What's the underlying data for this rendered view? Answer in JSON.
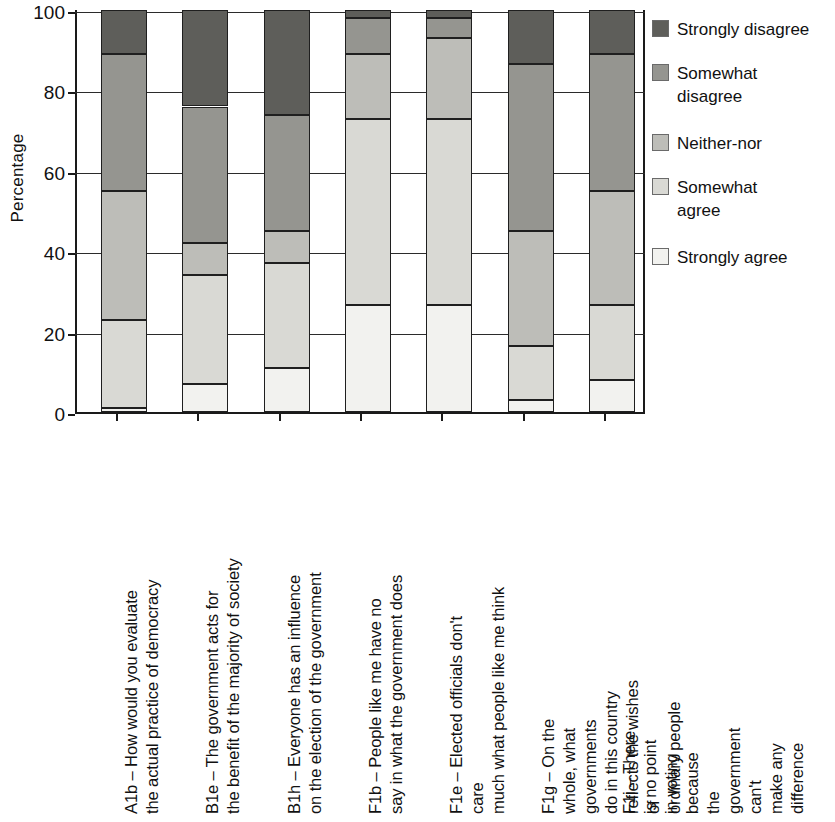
{
  "chart_data": {
    "type": "bar",
    "subtype": "stacked-bar-100",
    "title": "",
    "xlabel": "",
    "ylabel": "Percentage",
    "ylim": [
      0,
      100
    ],
    "yticks": [
      0,
      20,
      40,
      60,
      80,
      100
    ],
    "ytick_labels": [
      "0",
      "20",
      "40",
      "60",
      "80",
      "100"
    ],
    "grid": true,
    "legend_position": "right",
    "categories": [
      "A1b – How would you evaluate\nthe actual practice of democracy",
      "B1e – The government acts for\nthe benefit of the majority of society",
      "B1h – Everyone has an influence\non the election of the government",
      "F1b – People like me have no\nsay in what the government does",
      "F1e – Elected officials don't care\nmuch what people like me think",
      "F1g – On the whole, what governments\ndo in this country reflects the wishes of\nordinary people",
      "F1i – There is no point in voting\nbecause the government can't\nmake any difference"
    ],
    "series": [
      {
        "name": "Strongly agree",
        "color": "#f2f2ef",
        "values": [
          1,
          7,
          11,
          26.5,
          26.5,
          3,
          8
        ]
      },
      {
        "name": "Somewhat agree",
        "color": "#d9d9d4",
        "values": [
          22,
          27,
          26,
          46.5,
          46.5,
          13.5,
          18.5
        ]
      },
      {
        "name": "Neither-nor",
        "color": "#bdbdb8",
        "values": [
          32,
          8,
          8,
          16,
          20,
          28.5,
          28.5
        ]
      },
      {
        "name": "Somewhat disagree",
        "color": "#959590",
        "values": [
          34,
          34,
          29,
          9,
          5,
          41.5,
          34
        ]
      },
      {
        "name": "Strongly disagree",
        "color": "#5e5e5a",
        "values": [
          11,
          24,
          26,
          2,
          2,
          13.5,
          11
        ]
      }
    ],
    "legend_entries": [
      "Strongly disagree",
      "Somewhat\ndisagree",
      "Neither-nor",
      "Somewhat\nagree",
      "Strongly agree"
    ],
    "cumulative_boundaries": [
      [
        1,
        23,
        55,
        89,
        100
      ],
      [
        7,
        34,
        42,
        76,
        100
      ],
      [
        11,
        37,
        45,
        74,
        100
      ],
      [
        26.5,
        73,
        89,
        98,
        100
      ],
      [
        26.5,
        73,
        93,
        98,
        100
      ],
      [
        3,
        16.5,
        45,
        86.5,
        100
      ],
      [
        8,
        26.5,
        55,
        89,
        100
      ]
    ]
  },
  "axis": {
    "y_title": "Percentage"
  }
}
